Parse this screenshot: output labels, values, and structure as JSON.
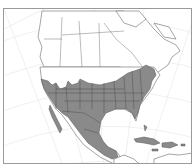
{
  "map": {
    "title": "",
    "region": "North America",
    "projection": "conic graticule",
    "range_fill_color": "#8a8a8a",
    "land_color": "#ffffff",
    "boundary_color": "#6a6a6a",
    "frame_color": "#9a9a9a",
    "range_description": "Shaded distribution covering southern and eastern United States, Mexico, and Greater Antilles (Cuba, Hispaniola, Jamaica)",
    "shaded_regions": [
      "Eastern United States",
      "Southwestern United States",
      "Mexico",
      "Cuba",
      "Hispaniola",
      "Jamaica"
    ]
  }
}
